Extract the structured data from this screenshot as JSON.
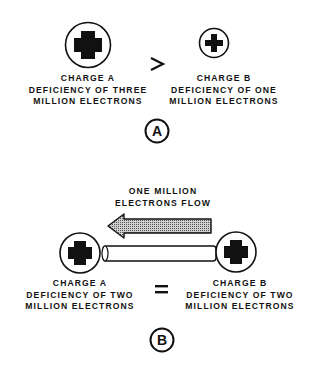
{
  "panel_a": {
    "id_label": "A",
    "comparison_symbol": ">",
    "charge_a": {
      "icon": "plus-charge-icon",
      "size": "large",
      "lines": [
        "CHARGE A",
        "DEFICIENCY OF THREE",
        "MILLION ELECTRONS"
      ]
    },
    "charge_b": {
      "icon": "plus-charge-icon",
      "size": "small",
      "lines": [
        "CHARGE B",
        "DEFICIENCY OF ONE",
        "MILLION ELECTRONS"
      ]
    }
  },
  "panel_b": {
    "id_label": "B",
    "comparison_symbol": "=",
    "flow_label": [
      "ONE MILLION",
      "ELECTRONS FLOW"
    ],
    "flow_direction": "left",
    "conductor": "rod",
    "charge_a": {
      "icon": "plus-charge-icon",
      "lines": [
        "CHARGE A",
        "DEFICIENCY OF TWO",
        "MILLION ELECTRONS"
      ]
    },
    "charge_b": {
      "icon": "plus-charge-icon",
      "lines": [
        "CHARGE B",
        "DEFICIENCY OF TWO",
        "MILLION ELECTRONS"
      ]
    }
  },
  "colors": {
    "ink": "#111111",
    "background": "#ffffff",
    "arrow_fill": "#9a9a9a"
  }
}
